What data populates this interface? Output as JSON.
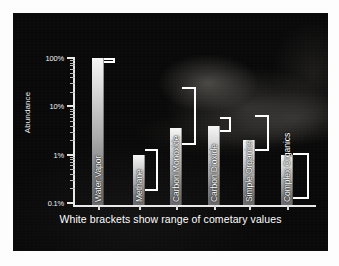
{
  "chart_data": {
    "type": "bar",
    "title": "",
    "subtitle": "",
    "xlabel": "",
    "ylabel": "Abundance",
    "yscale": "log",
    "ylim": [
      0.1,
      100
    ],
    "ytick_labels": [
      "100%",
      "10%",
      "1%",
      "0.1%"
    ],
    "ytick_values": [
      100,
      10,
      1,
      0.1
    ],
    "grid": false,
    "legend": null,
    "categories": [
      "Water Vapor",
      "Methane",
      "Carbon Monoxide",
      "Carbon Dioxide",
      "Simple Organics",
      "Complex Organics"
    ],
    "values": [
      100,
      1.0,
      3.5,
      4.0,
      2.0,
      1.0
    ],
    "annotation": "White brackets show range of cometary values",
    "bracket_ranges": [
      {
        "category": "Water Vapor",
        "low": 80,
        "high": 100
      },
      {
        "category": "Methane",
        "low": 0.18,
        "high": 1.3
      },
      {
        "category": "Carbon Monoxide",
        "low": 1.6,
        "high": 25
      },
      {
        "category": "Carbon Dioxide",
        "low": 3.0,
        "high": 6.0
      },
      {
        "category": "Simple Organics",
        "low": 1.2,
        "high": 6.5
      },
      {
        "category": "Complex Organics",
        "low": 0.12,
        "high": 1.1
      }
    ]
  },
  "figure": {
    "background_color": "#090909",
    "frame_color": "#ffffff",
    "bar_color_top": "#f6f6f6",
    "bar_color_bottom": "#6a6a6a",
    "axis_color": "#e9e9e9",
    "text_color": "#ffffff",
    "bracket_color": "#ffffff"
  }
}
